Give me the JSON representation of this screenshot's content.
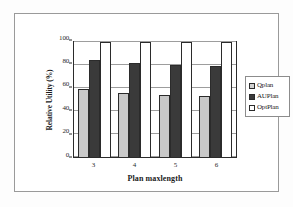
{
  "chart_data": {
    "type": "bar",
    "title": "",
    "xlabel": "Plan maxlength",
    "ylabel": "Relative Utility (%)",
    "categories": [
      "3",
      "4",
      "5",
      "6"
    ],
    "series": [
      {
        "name": "Qplan",
        "values": [
          59,
          56,
          54,
          53
        ],
        "color": "#c8c8c8"
      },
      {
        "name": "AUPlan",
        "values": [
          84,
          82,
          80,
          79
        ],
        "color": "#3a3a3a"
      },
      {
        "name": "OptPlan",
        "values": [
          100,
          100,
          100,
          100
        ],
        "color": "#ffffff"
      }
    ],
    "ylim": [
      0,
      100
    ],
    "yticks": [
      0,
      20,
      40,
      60,
      80,
      100
    ],
    "grid": true,
    "legend_position": "right"
  },
  "legend": {
    "entries": [
      {
        "label": "Qplan"
      },
      {
        "label": "AUPlan"
      },
      {
        "label": "OptPlan"
      }
    ]
  }
}
